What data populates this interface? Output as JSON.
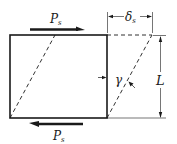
{
  "figure": {
    "type": "shear-deformation-diagram",
    "labels": {
      "force_top": "P",
      "force_top_sub": "s",
      "force_bottom": "P",
      "force_bottom_sub": "s",
      "displacement": "δ",
      "displacement_sub": "s",
      "length": "L",
      "shear_angle": "γ"
    },
    "colors": {
      "stroke": "#1a1a1a",
      "background": "#ffffff"
    }
  }
}
